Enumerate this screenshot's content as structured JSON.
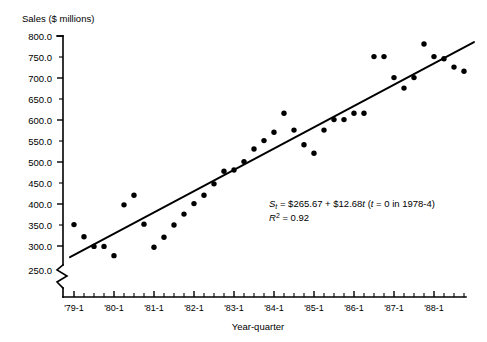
{
  "chart_data": {
    "type": "scatter",
    "title": "",
    "ylabel": "Sales ($ millions)",
    "xlabel": "Year-quarter",
    "ylim": [
      250,
      800
    ],
    "y_axis_break": true,
    "y_break_value": 250,
    "grid": false,
    "legend": "none",
    "y_ticks": [
      "800.0",
      "750.0",
      "700.0",
      "650.0",
      "600.0",
      "550.0",
      "500.0",
      "450.0",
      "400.0",
      "350.0",
      "300.0",
      "250.0"
    ],
    "y_tick_values": [
      800,
      750,
      700,
      650,
      600,
      550,
      500,
      450,
      400,
      350,
      300,
      250
    ],
    "y_major_ticks": [
      800,
      700,
      600,
      500,
      400,
      300
    ],
    "x_ticks": [
      "'79-1",
      "'80-1",
      "'81-1",
      "'82-1",
      "'83-1",
      "'84-1",
      "'85-1",
      "'86-1",
      "'87-1",
      "'88-1"
    ],
    "x_tick_values": [
      1,
      5,
      9,
      13,
      17,
      21,
      25,
      29,
      33,
      37
    ],
    "x_minor_interval_label": "quarter",
    "xlim": [
      0,
      41
    ],
    "series": [
      {
        "name": "Quarterly sales",
        "marker": "filled-circle",
        "color": "#000000",
        "points": [
          {
            "x": 1,
            "label": "'79-1",
            "y": 351
          },
          {
            "x": 2,
            "label": "'79-2",
            "y": 322
          },
          {
            "x": 3,
            "label": "'79-3",
            "y": 299
          },
          {
            "x": 4,
            "label": "'79-4",
            "y": 299
          },
          {
            "x": 5,
            "label": "'80-1",
            "y": 277
          },
          {
            "x": 6,
            "label": "'80-2",
            "y": 398
          },
          {
            "x": 7,
            "label": "'80-3",
            "y": 421
          },
          {
            "x": 8,
            "label": "'80-4",
            "y": 352
          },
          {
            "x": 9,
            "label": "'81-1",
            "y": 297
          },
          {
            "x": 10,
            "label": "'81-2",
            "y": 321
          },
          {
            "x": 11,
            "label": "'81-3",
            "y": 350
          },
          {
            "x": 12,
            "label": "'81-4",
            "y": 376
          },
          {
            "x": 13,
            "label": "'82-1",
            "y": 401
          },
          {
            "x": 14,
            "label": "'82-2",
            "y": 421
          },
          {
            "x": 15,
            "label": "'82-3",
            "y": 448
          },
          {
            "x": 16,
            "label": "'82-4",
            "y": 478
          },
          {
            "x": 17,
            "label": "'83-1",
            "y": 481
          },
          {
            "x": 18,
            "label": "'83-2",
            "y": 501
          },
          {
            "x": 19,
            "label": "'83-3",
            "y": 531
          },
          {
            "x": 20,
            "label": "'83-4",
            "y": 551
          },
          {
            "x": 21,
            "label": "'84-1",
            "y": 571
          },
          {
            "x": 22,
            "label": "'84-2",
            "y": 616
          },
          {
            "x": 23,
            "label": "'84-3",
            "y": 576
          },
          {
            "x": 24,
            "label": "'84-4",
            "y": 541
          },
          {
            "x": 25,
            "label": "'85-1",
            "y": 521
          },
          {
            "x": 26,
            "label": "'85-2",
            "y": 576
          },
          {
            "x": 27,
            "label": "'85-3",
            "y": 601
          },
          {
            "x": 28,
            "label": "'85-4",
            "y": 601
          },
          {
            "x": 29,
            "label": "'86-1",
            "y": 616
          },
          {
            "x": 30,
            "label": "'86-2",
            "y": 616
          },
          {
            "x": 31,
            "label": "'86-3",
            "y": 751
          },
          {
            "x": 32,
            "label": "'86-4",
            "y": 751
          },
          {
            "x": 33,
            "label": "'87-1",
            "y": 701
          },
          {
            "x": 34,
            "label": "'87-2",
            "y": 676
          },
          {
            "x": 35,
            "label": "'87-3",
            "y": 701
          },
          {
            "x": 36,
            "label": "'87-4",
            "y": 781
          },
          {
            "x": 37,
            "label": "'88-1",
            "y": 751
          },
          {
            "x": 38,
            "label": "'88-2",
            "y": 746
          },
          {
            "x": 39,
            "label": "'88-3",
            "y": 726
          },
          {
            "x": 40,
            "label": "'88-4",
            "y": 716
          }
        ]
      }
    ],
    "trend_line": {
      "name": "Least-squares trend",
      "intercept": 265.67,
      "slope": 12.68,
      "x_start": 0.6,
      "x_end": 41.0,
      "y_start": 273.3,
      "y_end": 785.6
    },
    "annotations": {
      "equation_prefix": "S",
      "equation_subscript": "t",
      "equation_body": " = $265.67 + $12.68",
      "equation_t": "t",
      "equation_paren_open": " (",
      "equation_t2": "t",
      "equation_paren_rest": " = 0 in 1978-4)",
      "r_squared_symbol": "R",
      "r_squared_exponent": "2",
      "r_squared_value": " = 0.92"
    }
  }
}
